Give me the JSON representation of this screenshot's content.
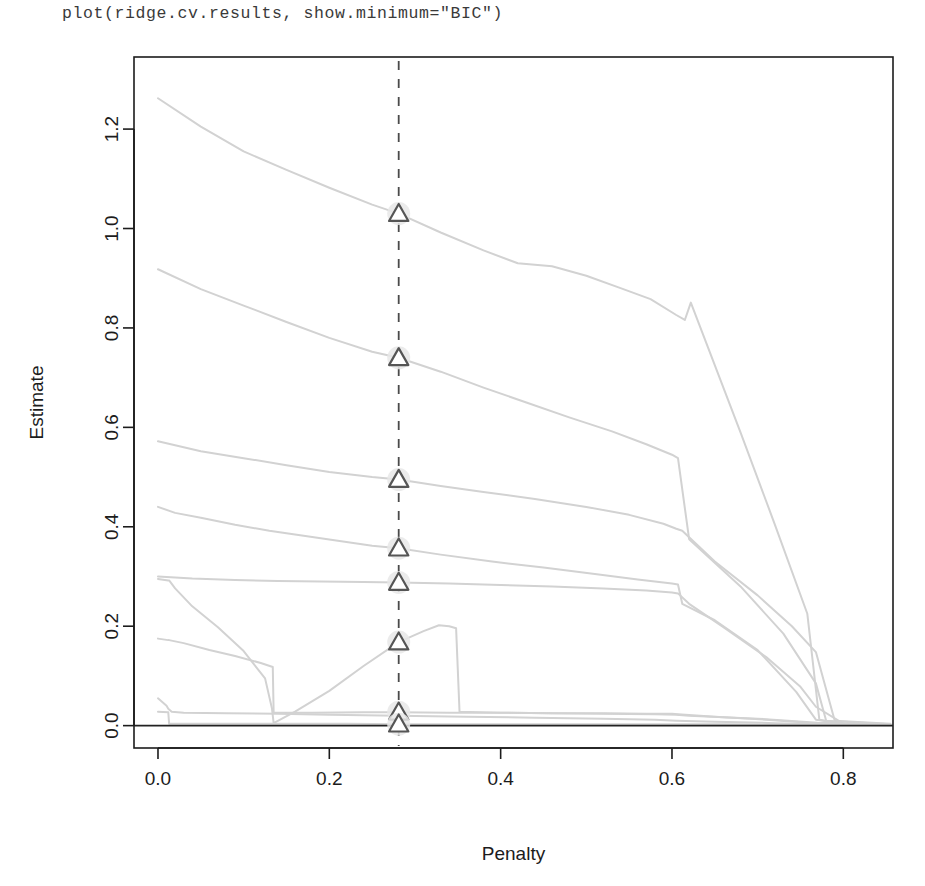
{
  "console": {
    "command": "plot(ridge.cv.results, show.minimum=\"BIC\")"
  },
  "plot": {
    "xlabel": "Penalty",
    "ylabel": "Estimate",
    "x_ticks": [
      "0.0",
      "0.2",
      "0.4",
      "0.6",
      "0.8"
    ],
    "y_ticks": [
      "0.0",
      "0.2",
      "0.4",
      "0.6",
      "0.8",
      "1.0",
      "1.2"
    ],
    "marker_shape": "triangle",
    "colors": {
      "curve": "#d2d2d2",
      "axis": "#1c1c1c",
      "marker_stroke": "#555555",
      "marker_fill": "#ffffff",
      "marker_halo": "#e8e8e8",
      "dashed_line": "#4a4a4a",
      "zero_line": "#222222"
    }
  },
  "chart_data": {
    "type": "line",
    "title": "",
    "xlabel": "Penalty",
    "ylabel": "Estimate",
    "xlim": [
      -0.028,
      0.858
    ],
    "ylim": [
      -0.045,
      1.345
    ],
    "x_ticks": [
      0.0,
      0.2,
      0.4,
      0.6,
      0.8
    ],
    "y_ticks": [
      0.0,
      0.2,
      0.4,
      0.6,
      0.8,
      1.0,
      1.2
    ],
    "grid": false,
    "legend": "none",
    "annotations": {
      "vertical_dashed_line_x": 0.281,
      "vertical_dashed_line_label": "BIC minimum",
      "zero_reference_line_y": 0.0
    },
    "minimum_markers": {
      "x": 0.281,
      "y_values": [
        1.03,
        0.74,
        0.495,
        0.357,
        0.288,
        0.168,
        0.027,
        0.003
      ]
    },
    "series": [
      {
        "name": "coef-1",
        "x": [
          0.0,
          0.05,
          0.1,
          0.15,
          0.2,
          0.25,
          0.281,
          0.33,
          0.38,
          0.42,
          0.46,
          0.5,
          0.54,
          0.575,
          0.605,
          0.615,
          0.622,
          0.64,
          0.68,
          0.72,
          0.758,
          0.772,
          0.8,
          0.855
        ],
        "y": [
          1.262,
          1.205,
          1.155,
          1.118,
          1.082,
          1.048,
          1.03,
          0.992,
          0.956,
          0.93,
          0.924,
          0.905,
          0.88,
          0.858,
          0.826,
          0.816,
          0.851,
          0.77,
          0.59,
          0.405,
          0.225,
          0.012,
          0.004,
          0.002
        ]
      },
      {
        "name": "coef-2",
        "x": [
          0.0,
          0.05,
          0.1,
          0.15,
          0.2,
          0.25,
          0.281,
          0.33,
          0.38,
          0.43,
          0.48,
          0.53,
          0.57,
          0.6,
          0.607,
          0.62,
          0.68,
          0.73,
          0.768,
          0.78,
          0.855
        ],
        "y": [
          0.918,
          0.878,
          0.845,
          0.812,
          0.78,
          0.752,
          0.74,
          0.712,
          0.68,
          0.65,
          0.62,
          0.592,
          0.566,
          0.545,
          0.538,
          0.375,
          0.28,
          0.185,
          0.085,
          0.01,
          0.003
        ]
      },
      {
        "name": "coef-3",
        "x": [
          0.0,
          0.05,
          0.1,
          0.15,
          0.2,
          0.25,
          0.281,
          0.33,
          0.38,
          0.44,
          0.5,
          0.55,
          0.59,
          0.605,
          0.612,
          0.65,
          0.7,
          0.74,
          0.768,
          0.79,
          0.855
        ],
        "y": [
          0.572,
          0.552,
          0.538,
          0.524,
          0.51,
          0.5,
          0.495,
          0.482,
          0.47,
          0.456,
          0.44,
          0.424,
          0.406,
          0.396,
          0.392,
          0.33,
          0.262,
          0.2,
          0.148,
          0.01,
          0.004
        ]
      },
      {
        "name": "coef-4",
        "x": [
          0.0,
          0.02,
          0.05,
          0.09,
          0.13,
          0.17,
          0.21,
          0.25,
          0.281,
          0.33,
          0.39,
          0.45,
          0.51,
          0.56,
          0.6,
          0.607,
          0.612,
          0.65,
          0.7,
          0.745,
          0.768,
          0.8,
          0.855
        ],
        "y": [
          0.44,
          0.428,
          0.418,
          0.404,
          0.392,
          0.382,
          0.372,
          0.362,
          0.357,
          0.344,
          0.33,
          0.318,
          0.305,
          0.294,
          0.286,
          0.284,
          0.245,
          0.212,
          0.152,
          0.068,
          0.012,
          0.004,
          0.002
        ]
      },
      {
        "name": "coef-5",
        "x": [
          0.0,
          0.04,
          0.09,
          0.14,
          0.19,
          0.24,
          0.281,
          0.34,
          0.4,
          0.46,
          0.52,
          0.57,
          0.6,
          0.607,
          0.62,
          0.66,
          0.71,
          0.75,
          0.768,
          0.8,
          0.855
        ],
        "y": [
          0.3,
          0.296,
          0.293,
          0.291,
          0.29,
          0.289,
          0.288,
          0.286,
          0.283,
          0.28,
          0.276,
          0.272,
          0.268,
          0.266,
          0.245,
          0.198,
          0.138,
          0.078,
          0.038,
          0.004,
          0.002
        ]
      },
      {
        "name": "coef-6",
        "x": [
          0.0,
          0.012,
          0.013,
          0.02,
          0.04,
          0.07,
          0.1,
          0.125,
          0.133,
          0.135,
          0.16,
          0.2,
          0.24,
          0.281,
          0.31,
          0.328,
          0.34,
          0.348,
          0.352,
          0.4,
          0.46,
          0.52,
          0.58,
          0.605,
          0.62,
          0.7,
          0.77,
          0.855
        ],
        "y": [
          0.295,
          0.292,
          0.292,
          0.276,
          0.24,
          0.198,
          0.15,
          0.095,
          0.035,
          0.005,
          0.028,
          0.07,
          0.12,
          0.168,
          0.19,
          0.202,
          0.2,
          0.196,
          0.028,
          0.026,
          0.025,
          0.024,
          0.023,
          0.022,
          0.02,
          0.014,
          0.006,
          0.002
        ]
      },
      {
        "name": "coef-7",
        "x": [
          0.0,
          0.012,
          0.013,
          0.03,
          0.06,
          0.09,
          0.12,
          0.134,
          0.135,
          0.18,
          0.24,
          0.281,
          0.34,
          0.4,
          0.46,
          0.52,
          0.57,
          0.6,
          0.607,
          0.65,
          0.71,
          0.76,
          0.8,
          0.855
        ],
        "y": [
          0.175,
          0.172,
          0.172,
          0.166,
          0.152,
          0.14,
          0.126,
          0.118,
          0.026,
          0.026,
          0.027,
          0.027,
          0.026,
          0.026,
          0.025,
          0.025,
          0.024,
          0.024,
          0.023,
          0.018,
          0.012,
          0.006,
          0.003,
          0.002
        ]
      },
      {
        "name": "coef-8",
        "x": [
          0.0,
          0.01,
          0.012,
          0.016,
          0.03,
          0.08,
          0.14,
          0.2,
          0.281,
          0.36,
          0.44,
          0.52,
          0.58,
          0.605,
          0.65,
          0.72,
          0.768,
          0.8,
          0.855
        ],
        "y": [
          0.055,
          0.04,
          0.034,
          0.028,
          0.026,
          0.025,
          0.024,
          0.022,
          0.02,
          0.018,
          0.016,
          0.014,
          0.012,
          0.01,
          0.008,
          0.005,
          0.003,
          0.002,
          0.001
        ]
      },
      {
        "name": "coef-9",
        "x": [
          0.0,
          0.012,
          0.013,
          0.06,
          0.14,
          0.22,
          0.281,
          0.36,
          0.44,
          0.52,
          0.58,
          0.605,
          0.66,
          0.72,
          0.768,
          0.82,
          0.855
        ],
        "y": [
          0.028,
          0.027,
          0.004,
          0.004,
          0.004,
          0.004,
          0.003,
          0.003,
          0.003,
          0.003,
          0.003,
          0.003,
          0.003,
          0.002,
          0.002,
          0.002,
          0.002
        ]
      }
    ]
  }
}
